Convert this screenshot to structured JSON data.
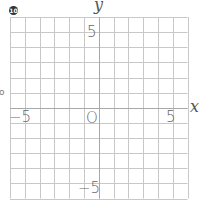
{
  "figure": {
    "badge": "10",
    "axis_labels": {
      "x": "x",
      "y": "y"
    },
    "origin_label": "O",
    "tick_labels": {
      "x_neg": "−5",
      "x_pos": "5",
      "y_pos": "5",
      "y_neg": "−5"
    },
    "stray_mark": "o",
    "grid": {
      "columns": 12,
      "rows": 12,
      "x_range": [
        -6,
        6
      ],
      "y_range": [
        -6,
        6
      ],
      "line_color": "#c8c8c8",
      "axis_color": "#a8a8a8"
    }
  }
}
